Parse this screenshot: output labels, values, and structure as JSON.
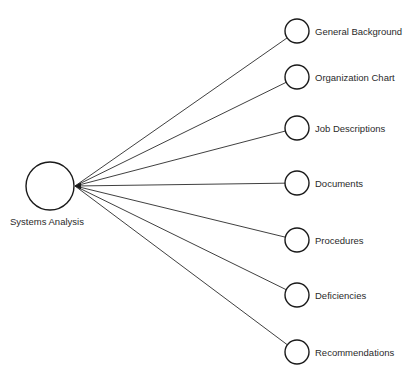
{
  "diagram": {
    "type": "hub-and-spoke",
    "hub": {
      "label": "Systems Analysis",
      "cx": 50,
      "cy": 186,
      "r": 24,
      "label_x": 10,
      "label_y": 225
    },
    "arrow_tip": {
      "x": 75,
      "y": 186
    },
    "spokes": [
      {
        "label": "General Background",
        "cx": 297,
        "cy": 31
      },
      {
        "label": "Organization Chart",
        "cx": 297,
        "cy": 77
      },
      {
        "label": "Job Descriptions",
        "cx": 297,
        "cy": 128
      },
      {
        "label": "Documents",
        "cx": 297,
        "cy": 183
      },
      {
        "label": "Procedures",
        "cx": 297,
        "cy": 240
      },
      {
        "label": "Deficiencies",
        "cx": 297,
        "cy": 295
      },
      {
        "label": "Recommendations",
        "cx": 297,
        "cy": 352
      }
    ],
    "spoke_radius": 12
  }
}
